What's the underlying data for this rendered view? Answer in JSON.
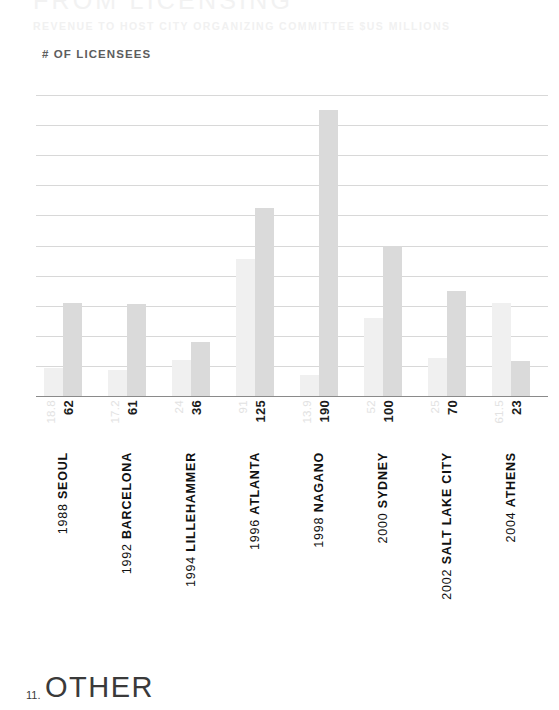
{
  "header": {
    "title": "FROM LICENSING",
    "subtitle": "REVENUE TO HOST CITY ORGANIZING COMMITTEE $US MILLIONS",
    "series_label": "# OF LICENSEES"
  },
  "footer": {
    "number": "11.",
    "label": "OTHER"
  },
  "colors": {
    "revenue_bar": "#f0f0f0",
    "licensees_bar": "#dadada",
    "gridline": "#d8d8d8",
    "baseline": "#8a8a8a",
    "title_text": "#f2f2f2",
    "value_revenue_text": "#e2e2e2",
    "value_licensees_text": "#1c1c1c",
    "category_text": "#111111"
  },
  "chart_data": {
    "type": "bar",
    "title": "FROM LICENSING",
    "subtitle": "REVENUE TO HOST CITY ORGANIZING COMMITTEE $US MILLIONS",
    "xlabel": "",
    "ylabel": "",
    "ylim": [
      0,
      200
    ],
    "yticks": [
      200,
      180,
      160,
      140,
      120,
      100,
      80,
      60,
      40,
      20,
      0
    ],
    "ytick_labels": [
      "200",
      "180",
      "160",
      "140",
      "120",
      "100",
      "80",
      "60",
      "40",
      "20",
      "0"
    ],
    "grid": true,
    "legend_position": "none",
    "categories": [
      "1988 SEOUL",
      "1992 BARCELONA",
      "1994 LILLEHAMMER",
      "1996 ATLANTA",
      "1998 NAGANO",
      "2000 SYDNEY",
      "2002 SALT LAKE CITY",
      "2004 ATHENS"
    ],
    "category_parts": [
      {
        "year": "1988",
        "city": "SEOUL"
      },
      {
        "year": "1992",
        "city": "BARCELONA"
      },
      {
        "year": "1994",
        "city": "LILLEHAMMER"
      },
      {
        "year": "1996",
        "city": "ATLANTA"
      },
      {
        "year": "1998",
        "city": "NAGANO"
      },
      {
        "year": "2000",
        "city": "SYDNEY"
      },
      {
        "year": "2002",
        "city": "SALT LAKE CITY"
      },
      {
        "year": "2004",
        "city": "ATHENS"
      }
    ],
    "series": [
      {
        "name": "REVENUE TO HOST CITY ORGANIZING COMMITTEE $US MILLIONS",
        "key": "revenue",
        "values": [
          18.8,
          17.2,
          24,
          91,
          13.9,
          52,
          25,
          61.5
        ],
        "value_labels": [
          "18.8",
          "17.2",
          "24",
          "91",
          "13.9",
          "52",
          "25",
          "61.5"
        ],
        "color": "#f0f0f0"
      },
      {
        "name": "# OF LICENSEES",
        "key": "licensees",
        "values": [
          62,
          61,
          36,
          125,
          190,
          100,
          70,
          23
        ],
        "value_labels": [
          "62",
          "61",
          "36",
          "125",
          "190",
          "100",
          "70",
          "23"
        ],
        "color": "#dadada"
      }
    ]
  }
}
